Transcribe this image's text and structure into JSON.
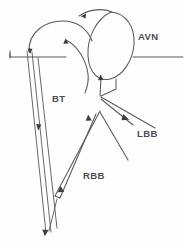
{
  "diagram": {
    "background_color": "#fefefe",
    "line_color": "#555a60",
    "arrow_color": "#3b3f44",
    "label_color": "#4a4e53",
    "labels": [
      {
        "id": "avn",
        "text": "AVN",
        "meaning": "atrioventricular-node",
        "x": 138,
        "y": 37
      },
      {
        "id": "bt",
        "text": "BT",
        "meaning": "bypass-tract",
        "x": 52,
        "y": 99
      },
      {
        "id": "lbb",
        "text": "LBB",
        "meaning": "left-bundle-branch",
        "x": 137,
        "y": 134
      },
      {
        "id": "rbb",
        "text": "RBB",
        "meaning": "right-bundle-branch",
        "x": 83,
        "y": 176
      }
    ],
    "structures": [
      {
        "id": "atrial-loop-left",
        "name": "left-atrial-loop"
      },
      {
        "id": "avn-circle",
        "name": "avn-circle"
      },
      {
        "id": "atrial-line-left",
        "name": "left-atrial-line"
      },
      {
        "id": "atrial-line-right",
        "name": "right-atrial-line"
      },
      {
        "id": "bypass-tract",
        "name": "bypass-tract-pathway"
      },
      {
        "id": "his-bundle",
        "name": "his-bundle"
      },
      {
        "id": "lbb-branch",
        "name": "left-bundle-branch-pathway"
      },
      {
        "id": "rbb-branch",
        "name": "right-bundle-branch-pathway"
      }
    ],
    "arrow_count": 8,
    "arrow_directions": [
      "left",
      "up",
      "down",
      "down",
      "up",
      "up",
      "down-right",
      "down"
    ]
  }
}
